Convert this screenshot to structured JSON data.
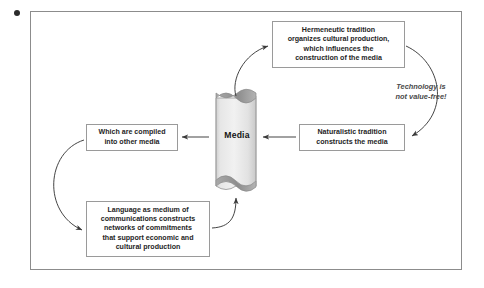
{
  "diagram": {
    "title_dot": "decorative-dot",
    "frame": {
      "border_color": "#8c8c8c",
      "background": "#ffffff"
    },
    "center": {
      "label": "Media",
      "shape": "cylinder-scroll",
      "fill_color": "#e8e8e8",
      "cap_color": "#8f8f8f"
    },
    "nodes": [
      {
        "id": "hermeneutic",
        "text": "Hermeneutic tradition\norganizes  cultural production,\nwhich influences the\nconstruction of the media"
      },
      {
        "id": "naturalistic",
        "text": "Naturalistic tradition\nconstructs the media"
      },
      {
        "id": "compiled",
        "text": "Which are compiled\ninto other media"
      },
      {
        "id": "language",
        "text": "Language as medium of\ncommunications constructs\nnetworks of commitments\nthat support economic and\ncultural production"
      }
    ],
    "annotation": {
      "text": "Technology is\nnot value-free!",
      "style": "italic"
    },
    "connectors": [
      {
        "id": "media-to-hermeneutic",
        "kind": "curved-arrow",
        "direction": "up-right"
      },
      {
        "id": "hermeneutic-to-naturalistic",
        "kind": "curved-arrow",
        "direction": "down-left"
      },
      {
        "id": "naturalistic-to-media",
        "kind": "straight-arrow",
        "direction": "left"
      },
      {
        "id": "media-to-compiled",
        "kind": "straight-arrow",
        "direction": "left"
      },
      {
        "id": "compiled-to-language",
        "kind": "curved-arrow",
        "direction": "down-right"
      },
      {
        "id": "language-to-media",
        "kind": "curved-arrow",
        "direction": "up-right"
      }
    ],
    "stroke_color": "#3a3a3a"
  }
}
